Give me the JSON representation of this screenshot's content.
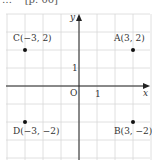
{
  "header": {
    "text": "[p. 00]",
    "prefix": "…"
  },
  "diagram": {
    "type": "coordinate-plane",
    "axes": {
      "x_label": "x",
      "y_label": "y",
      "origin_label": "O",
      "unit_x_label": "1",
      "unit_y_label": "1"
    },
    "grid": {
      "x_min": -4,
      "x_max": 4,
      "y_min": -4,
      "y_max": 4,
      "step": 1
    },
    "points": [
      {
        "name": "A",
        "x": 3,
        "y": 2,
        "label": "A(3, 2)"
      },
      {
        "name": "B",
        "x": 3,
        "y": -2,
        "label": "B(3, −2)"
      },
      {
        "name": "C",
        "x": -3,
        "y": 2,
        "label": "C(−3, 2)"
      },
      {
        "name": "D",
        "x": -3,
        "y": -2,
        "label": "D(−3, −2)"
      }
    ],
    "colors": {
      "grid": "#d8d8d8",
      "axis": "#222222",
      "point": "#111111",
      "text": "#333333"
    }
  }
}
